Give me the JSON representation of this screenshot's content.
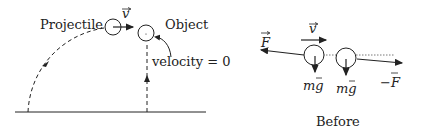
{
  "left_panel": {
    "projectile_label": "Projectile",
    "object_label": "Object",
    "velocity_vector_label": "v",
    "velocity_zero_label": "velocity = 0"
  },
  "right_panel": {
    "force_label": "F",
    "velocity_label": "v",
    "gravity_label_1": "mg",
    "gravity_label_2": "mg",
    "neg_force_label": "−F",
    "caption": "Before"
  },
  "colors": {
    "stroke": "#222222",
    "background": "#ffffff"
  }
}
